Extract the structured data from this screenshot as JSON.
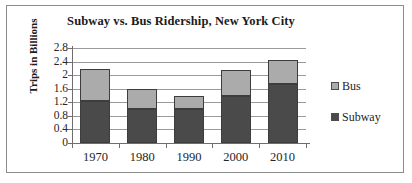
{
  "chart_data": {
    "type": "bar",
    "subtype": "stacked-vertical",
    "title": "Subway vs. Bus Ridership, New York City",
    "xlabel": "",
    "ylabel": "Trips in Billions",
    "categories": [
      "1970",
      "1980",
      "1990",
      "2000",
      "2010"
    ],
    "series": [
      {
        "name": "Subway",
        "color": "#4a4a4a",
        "values": [
          1.25,
          1.0,
          1.0,
          1.4,
          1.75
        ]
      },
      {
        "name": "Bus",
        "color": "#ababab",
        "values": [
          0.93,
          0.6,
          0.4,
          0.74,
          0.7
        ]
      }
    ],
    "totals": [
      2.18,
      1.6,
      1.4,
      2.14,
      2.45
    ],
    "ylim": [
      0,
      2.8
    ],
    "ytick_values": [
      0,
      0.4,
      0.8,
      1.2,
      1.6,
      2,
      2.4,
      2.8
    ],
    "ytick_labels": [
      "0",
      "0.4",
      "0.8",
      "1.2",
      "1.6",
      "2",
      "2.4",
      "2.8"
    ],
    "grid": true,
    "legend_position": "right",
    "legend": [
      {
        "label": "Bus",
        "color": "#ababab"
      },
      {
        "label": "Subway",
        "color": "#4a4a4a"
      }
    ]
  },
  "colors": {
    "subway": "#4a4a4a",
    "bus": "#ababab",
    "axis": "#6e6e6e",
    "grid": "#9a9a9a",
    "frame": "#8c8c8c",
    "text": "#1a1a1a",
    "background": "#ffffff"
  }
}
